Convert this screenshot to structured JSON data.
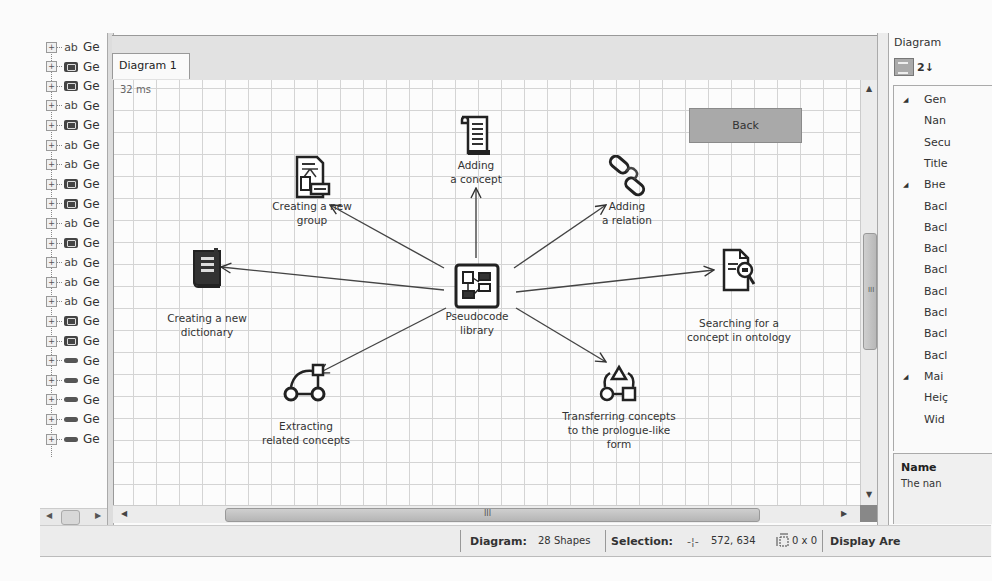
{
  "tree": {
    "items": [
      {
        "type": "ab",
        "label": "Ge"
      },
      {
        "type": "control",
        "label": "Ge"
      },
      {
        "type": "control",
        "label": "Ge"
      },
      {
        "type": "ab",
        "label": "Ge"
      },
      {
        "type": "control",
        "label": "Ge"
      },
      {
        "type": "ab",
        "label": "Ge"
      },
      {
        "type": "ab",
        "label": "Ge"
      },
      {
        "type": "control",
        "label": "Ge"
      },
      {
        "type": "control",
        "label": "Ge"
      },
      {
        "type": "ab",
        "label": "Ge"
      },
      {
        "type": "control",
        "label": "Ge"
      },
      {
        "type": "ab",
        "label": "Ge"
      },
      {
        "type": "ab",
        "label": "Ge"
      },
      {
        "type": "ab",
        "label": "Ge"
      },
      {
        "type": "control",
        "label": "Ge"
      },
      {
        "type": "control",
        "label": "Ge"
      },
      {
        "type": "rect",
        "label": "Ge"
      },
      {
        "type": "rect",
        "label": "Ge"
      },
      {
        "type": "rect",
        "label": "Ge"
      },
      {
        "type": "rect",
        "label": "Ge"
      },
      {
        "type": "rect",
        "label": "Ge"
      }
    ],
    "ab_glyph": "ab",
    "expander_glyph": "+"
  },
  "tabs": [
    {
      "label": "Diagram 1",
      "active": true
    }
  ],
  "canvas": {
    "timing": "32 ms",
    "back_button": "Back",
    "nodes": {
      "center": {
        "line1": "Pseudocode",
        "line2": "library",
        "icon": "library-icon"
      },
      "adding_concept": {
        "line1": "Adding",
        "line2": "a concept",
        "icon": "scroll-document-icon"
      },
      "new_group": {
        "line1": "Creating a new",
        "line2": "group",
        "icon": "group-document-icon"
      },
      "adding_relation": {
        "line1": "Adding",
        "line2": "a relation",
        "icon": "chain-link-icon"
      },
      "new_dictionary": {
        "line1": "Creating a new",
        "line2": "dictionary",
        "icon": "book-icon"
      },
      "search": {
        "line1": "Searching for a",
        "line2": "concept in ontology",
        "icon": "document-search-icon"
      },
      "extracting": {
        "line1": "Extracting",
        "line2": "related concepts",
        "icon": "graph-nodes-icon"
      },
      "transferring": {
        "line1": "Transferring concepts",
        "line2": "to the prologue-like",
        "line3": "form",
        "icon": "shapes-icon"
      }
    }
  },
  "scrollbars": {
    "horizontal_grip": "III",
    "vertical_grip": "III"
  },
  "properties": {
    "title": "Diagram",
    "sort_glyph": "2↓",
    "rows": [
      {
        "kind": "category",
        "label": "Gen"
      },
      {
        "kind": "prop",
        "label": "Nan"
      },
      {
        "kind": "prop",
        "label": "Secu"
      },
      {
        "kind": "prop",
        "label": "Title"
      },
      {
        "kind": "category",
        "label": "Bнe"
      },
      {
        "kind": "prop",
        "label": "Bacl"
      },
      {
        "kind": "prop",
        "label": "Bacl"
      },
      {
        "kind": "prop",
        "label": "Bacl"
      },
      {
        "kind": "prop",
        "label": "Bacl"
      },
      {
        "kind": "prop",
        "label": "Bacl"
      },
      {
        "kind": "prop",
        "label": "Bacl"
      },
      {
        "kind": "prop",
        "label": "Bacl"
      },
      {
        "kind": "prop",
        "label": "Bacl"
      },
      {
        "kind": "category",
        "label": "Mai"
      },
      {
        "kind": "prop",
        "label": "Heiç"
      },
      {
        "kind": "prop",
        "label": "Wid"
      }
    ],
    "description_title": "Name",
    "description_text": "The nan"
  },
  "statusbar": {
    "diagram_label": "Diagram:",
    "shapes": "28 Shapes",
    "selection_label": "Selection:",
    "position": "572, 634",
    "size": "0 x 0",
    "display_label": "Display Are"
  }
}
